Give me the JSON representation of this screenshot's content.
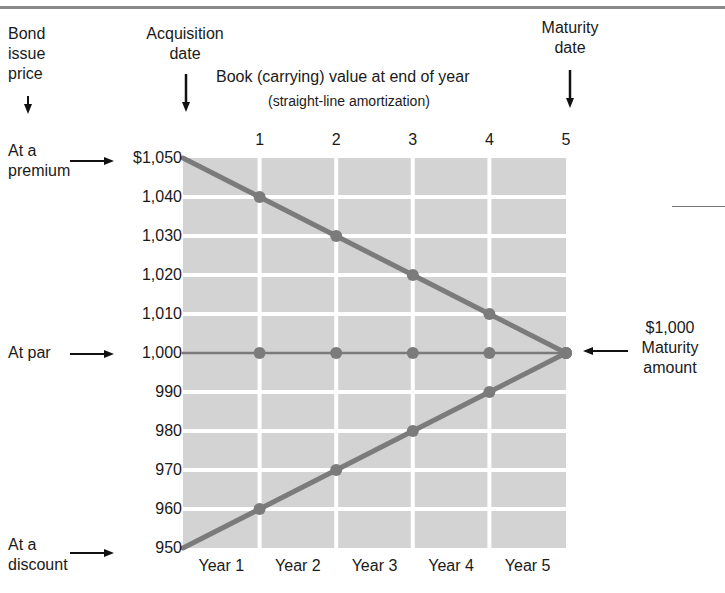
{
  "chart_data": {
    "type": "line",
    "title": "Book (carrying) value at end of year",
    "subtitle": "(straight-line amortization)",
    "xlabel": "",
    "ylabel": "",
    "x": [
      0,
      1,
      2,
      3,
      4,
      5
    ],
    "x_top_ticks": [
      "1",
      "2",
      "3",
      "4",
      "5"
    ],
    "x_bottom_labels": [
      "Year 1",
      "Year 2",
      "Year 3",
      "Year 4",
      "Year 5"
    ],
    "y_ticks": [
      "$1,050",
      "1,040",
      "1,030",
      "1,020",
      "1,010",
      "1,000",
      "990",
      "980",
      "970",
      "960",
      "950"
    ],
    "ylim": [
      950,
      1050
    ],
    "grid": true,
    "series": [
      {
        "name": "At a premium",
        "values": [
          1050,
          1040,
          1030,
          1020,
          1010,
          1000
        ]
      },
      {
        "name": "At par",
        "values": [
          1000,
          1000,
          1000,
          1000,
          1000,
          1000
        ]
      },
      {
        "name": "At a discount",
        "values": [
          950,
          960,
          970,
          980,
          990,
          1000
        ]
      }
    ],
    "annotations": [
      "Bond issue price",
      "Acquisition date",
      "Maturity date",
      "$1,000 Maturity amount"
    ]
  },
  "labels": {
    "bond_issue_price": [
      "Bond",
      "issue",
      "price"
    ],
    "acquisition_date": [
      "Acquisition",
      "date"
    ],
    "maturity_date": [
      "Maturity",
      "date"
    ],
    "title": "Book (carrying) value at end of year",
    "subtitle": "(straight-line amortization)",
    "premium": [
      "At a",
      "premium"
    ],
    "par": "At par",
    "discount": [
      "At a",
      "discount"
    ],
    "maturity_amount": [
      "$1,000",
      "Maturity",
      "amount"
    ]
  },
  "colors": {
    "grid_fill": "#d3d3d3",
    "grid_line": "#ffffff",
    "series_line": "#7b7b7b",
    "text": "#1a1a1a"
  }
}
